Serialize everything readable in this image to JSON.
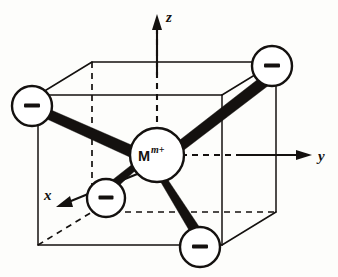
{
  "figure": {
    "name": "tetrahedral-complex-in-cube",
    "background_color": "#fdfdfb",
    "ink_color": "#14110f"
  },
  "axes": {
    "z": {
      "label": "z",
      "direction": "up"
    },
    "y": {
      "label": "y",
      "direction": "right"
    },
    "x": {
      "label": "x",
      "direction": "down-left"
    }
  },
  "center_atom": {
    "symbol": "M",
    "superscript": "m+",
    "full_label": "M m+"
  },
  "ligands": [
    {
      "id": "ligand-upper-left",
      "charge": "−",
      "position": "upper-left"
    },
    {
      "id": "ligand-upper-right",
      "charge": "−",
      "position": "upper-right"
    },
    {
      "id": "ligand-lower-left",
      "charge": "−",
      "position": "lower-left"
    },
    {
      "id": "ligand-lower-right",
      "charge": "−",
      "position": "lower-right"
    }
  ],
  "cube": {
    "visible_edges": "solid",
    "hidden_edges": "dashed"
  },
  "bonds": {
    "count": 4,
    "style": "solid-wedge"
  }
}
